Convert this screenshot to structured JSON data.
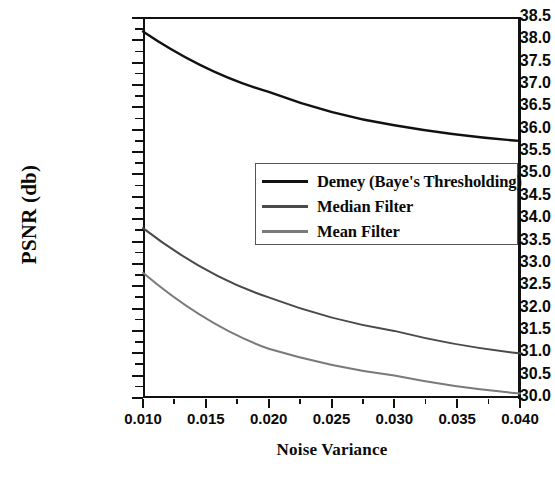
{
  "chart_data": {
    "type": "line",
    "title": "",
    "xlabel": "Noise Variance",
    "ylabel": "PSNR (db)",
    "xlim": [
      0.01,
      0.04
    ],
    "ylim": [
      30.0,
      38.5
    ],
    "grid": false,
    "legend_position": "center",
    "x": [
      0.01,
      0.02,
      0.03,
      0.04
    ],
    "xticks": [
      "0.010",
      "0.015",
      "0.020",
      "0.025",
      "0.030",
      "0.035",
      "0.040"
    ],
    "yticks": [
      "38.5",
      "38.0",
      "37.5",
      "37.0",
      "36.5",
      "36.0",
      "35.5",
      "35.0",
      "34.5",
      "34.0",
      "33.5",
      "33.0",
      "32.5",
      "32.0",
      "31.5",
      "31.0",
      "30.5",
      "30.0"
    ],
    "series": [
      {
        "name": "Demey (Baye's Thresholding)",
        "color": "#111111",
        "values": [
          38.2,
          36.85,
          36.1,
          35.75
        ]
      },
      {
        "name": "Median Filter",
        "color": "#4a4a4a",
        "values": [
          33.8,
          32.25,
          31.5,
          31.0
        ]
      },
      {
        "name": "Mean Filter",
        "color": "#7a7a7a",
        "values": [
          32.8,
          31.1,
          30.5,
          30.1
        ]
      }
    ]
  }
}
